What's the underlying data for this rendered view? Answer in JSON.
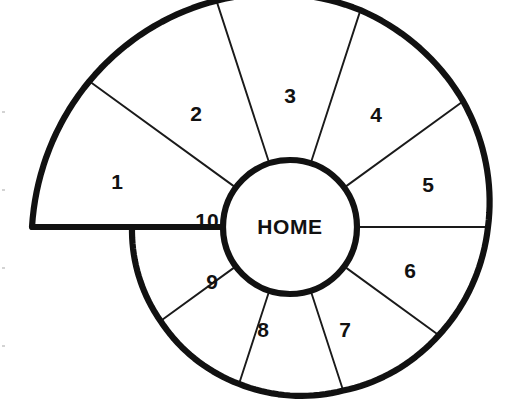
{
  "diagram": {
    "type": "radial-spiral-sector-map",
    "canvas": {
      "width": 514,
      "height": 414,
      "background": "#ffffff"
    },
    "center": {
      "x": 290,
      "y": 227
    },
    "hub": {
      "label": "HOME",
      "radius": 67,
      "stroke": "#111111",
      "fill": "#ffffff",
      "stroke_width": 6.2
    },
    "style": {
      "outline_color": "#111111",
      "divider_color": "#1a1a1a",
      "outline_width": 6.2,
      "divider_width": 1.9,
      "label_color": "#111111",
      "fill_color": "#ffffff"
    },
    "sector_count": 10,
    "sectors": [
      {
        "id": 1,
        "label": "1",
        "start_deg": 180,
        "end_deg": 144,
        "r_outer_start": 258,
        "r_outer_end": 248,
        "label_x": 117,
        "label_y": 183
      },
      {
        "id": 2,
        "label": "2",
        "start_deg": 144,
        "end_deg": 108,
        "r_outer_start": 248,
        "r_outer_end": 238,
        "label_x": 196,
        "label_y": 115
      },
      {
        "id": 3,
        "label": "3",
        "start_deg": 108,
        "end_deg": 72,
        "r_outer_start": 238,
        "r_outer_end": 228,
        "label_x": 290,
        "label_y": 97
      },
      {
        "id": 4,
        "label": "4",
        "start_deg": 72,
        "end_deg": 36,
        "r_outer_start": 228,
        "r_outer_end": 214,
        "label_x": 376,
        "label_y": 116
      },
      {
        "id": 5,
        "label": "5",
        "start_deg": 36,
        "end_deg": 0,
        "r_outer_start": 214,
        "r_outer_end": 198,
        "label_x": 428,
        "label_y": 186
      },
      {
        "id": 6,
        "label": "6",
        "start_deg": 0,
        "end_deg": -36,
        "r_outer_start": 198,
        "r_outer_end": 184,
        "label_x": 410,
        "label_y": 272
      },
      {
        "id": 7,
        "label": "7",
        "start_deg": -36,
        "end_deg": -72,
        "r_outer_start": 184,
        "r_outer_end": 172,
        "label_x": 345,
        "label_y": 331
      },
      {
        "id": 8,
        "label": "8",
        "start_deg": -72,
        "end_deg": -108,
        "r_outer_start": 172,
        "r_outer_end": 165,
        "label_x": 263,
        "label_y": 331
      },
      {
        "id": 9,
        "label": "9",
        "start_deg": -108,
        "end_deg": -144,
        "r_outer_start": 165,
        "r_outer_end": 160,
        "label_x": 212,
        "label_y": 283
      },
      {
        "id": 10,
        "label": "10",
        "start_deg": -144,
        "end_deg": -180,
        "r_outer_start": 160,
        "r_outer_end": 158,
        "label_x": 207,
        "label_y": 222
      }
    ]
  }
}
